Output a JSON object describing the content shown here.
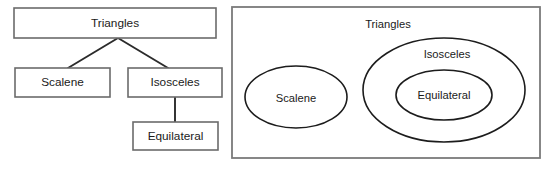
{
  "figure": {
    "background_color": "#ffffff",
    "box_stroke_color": "#6b6b6b",
    "connector_color": "#2b2b2b",
    "ellipse_stroke_color": "#1c1c1c",
    "text_color": "#1a1a1a"
  },
  "tree": {
    "name": "triangle-hierarchy-tree",
    "nodes": {
      "root": {
        "label": "Triangles",
        "x": 14,
        "y": 8,
        "w": 202,
        "h": 30
      },
      "left_child": {
        "label": "Scalene",
        "x": 15,
        "y": 68,
        "w": 95,
        "h": 29
      },
      "right_child": {
        "label": "Isosceles",
        "x": 128,
        "y": 68,
        "w": 94,
        "h": 29
      },
      "grandchild": {
        "label": "Equilateral",
        "x": 133,
        "y": 122,
        "w": 85,
        "h": 28
      }
    },
    "edges": [
      {
        "name": "root-to-scalene",
        "x1": 118,
        "y1": 38,
        "x2": 68,
        "y2": 68
      },
      {
        "name": "root-to-isosceles",
        "x1": 118,
        "y1": 38,
        "x2": 168,
        "y2": 68
      },
      {
        "name": "isosceles-to-equilateral",
        "x1": 175,
        "y1": 97,
        "x2": 175,
        "y2": 122
      }
    ]
  },
  "venn": {
    "name": "triangle-euler-diagram",
    "universe": {
      "label": "Triangles",
      "x": 232,
      "y": 7,
      "w": 308,
      "h": 151,
      "label_x": 388,
      "label_y": 25
    },
    "sets": [
      {
        "key": "scalene",
        "label": "Scalene",
        "cx": 296,
        "cy": 97,
        "rx": 51,
        "ry": 31,
        "label_x": 296,
        "label_y": 99
      },
      {
        "key": "isosceles",
        "label": "Isosceles",
        "cx": 444,
        "cy": 90,
        "rx": 81,
        "ry": 52,
        "label_x": 447,
        "label_y": 55
      },
      {
        "key": "equilateral",
        "label": "Equilateral",
        "cx": 444,
        "cy": 95,
        "rx": 48,
        "ry": 25,
        "label_x": 444,
        "label_y": 96
      }
    ]
  }
}
